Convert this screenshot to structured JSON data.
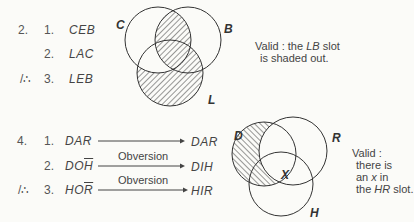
{
  "problem2": {
    "number": "2.",
    "steps": [
      {
        "index": "1.",
        "premise": "CEB"
      },
      {
        "index": "2.",
        "premise": "LAC"
      },
      {
        "index": "3.",
        "therefore": "/∴",
        "premise": "LEB"
      }
    ],
    "diagram": {
      "circles": [
        {
          "label": "C",
          "cx": 158,
          "cy": 40,
          "r": 33
        },
        {
          "label": "B",
          "cx": 188,
          "cy": 40,
          "r": 33
        },
        {
          "label": "L",
          "cx": 170,
          "cy": 73,
          "r": 33
        }
      ],
      "shaded_regions": [
        "C∩B",
        "L−C"
      ]
    },
    "note": {
      "line1_pre": "Valid : the ",
      "line1_em": "LB",
      "line1_post": " slot",
      "line2": "is shaded out."
    }
  },
  "problem4": {
    "number": "4.",
    "steps": [
      {
        "index": "1.",
        "premise": "DAR",
        "premise_base": "DA",
        "premise_bar": "R",
        "arrow_label": "",
        "result": "DAR"
      },
      {
        "index": "2.",
        "premise": "DOH̄",
        "premise_base": "DO",
        "premise_bar": "H",
        "arrow_label": "Obversion",
        "result": "DIH"
      },
      {
        "index": "3.",
        "therefore": "/∴",
        "premise": "HOR̄",
        "premise_base": "HO",
        "premise_bar": "R",
        "arrow_label": "Obversion",
        "result": "HIR"
      }
    ],
    "diagram": {
      "circles": [
        {
          "label": "D",
          "cx": 264,
          "cy": 154,
          "r": 32
        },
        {
          "label": "R",
          "cx": 293,
          "cy": 151,
          "r": 34
        },
        {
          "label": "H",
          "cx": 281,
          "cy": 184,
          "r": 32
        }
      ],
      "shaded_regions": [
        "D−R"
      ],
      "x_mark": {
        "label": "X",
        "region": "HR"
      }
    },
    "note": {
      "line1": "Valid :",
      "line2": "there is",
      "line3_pre": "an ",
      "line3_em": "x",
      "line3_post": " in",
      "line4_pre": "the ",
      "line4_em": "HR",
      "line4_post": " slot."
    }
  }
}
